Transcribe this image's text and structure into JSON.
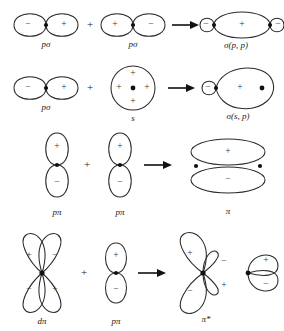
{
  "figure": {
    "background_color": "#ffffff",
    "stroke_color": "#2a2a2a",
    "nucleus_color": "#111111",
    "operator_plus": "+",
    "rows": [
      {
        "id": "row-sigma-p-p",
        "reactant_a": {
          "label": "pσ",
          "type": "p-orbital-horizontal",
          "lobes": [
            {
              "position": "left",
              "sign": "−"
            },
            {
              "position": "right",
              "sign": "+"
            }
          ]
        },
        "reactant_b": {
          "label": "pσ",
          "type": "p-orbital-horizontal",
          "lobes": [
            {
              "position": "left",
              "sign": "+"
            },
            {
              "position": "right",
              "sign": "−"
            }
          ]
        },
        "product": {
          "label": "σ(p, p)",
          "type": "sigma-bond-p-p",
          "lobes": [
            {
              "position": "left-small",
              "sign": "−"
            },
            {
              "position": "center-large",
              "sign": "+"
            },
            {
              "position": "right-small",
              "sign": "−"
            }
          ]
        }
      },
      {
        "id": "row-sigma-s-p",
        "reactant_a": {
          "label": "pσ",
          "type": "p-orbital-horizontal",
          "lobes": [
            {
              "position": "left",
              "sign": "−"
            },
            {
              "position": "right",
              "sign": "+"
            }
          ]
        },
        "reactant_b": {
          "label": "s",
          "type": "s-orbital-circle",
          "lobes": [
            {
              "position": "top",
              "sign": "+"
            },
            {
              "position": "left",
              "sign": "+"
            },
            {
              "position": "right",
              "sign": "+"
            },
            {
              "position": "bottom",
              "sign": "+"
            }
          ]
        },
        "product": {
          "label": "σ(s, p)",
          "type": "sigma-bond-s-p",
          "lobes": [
            {
              "position": "left-small",
              "sign": "−"
            },
            {
              "position": "right-large",
              "sign": "+"
            }
          ]
        }
      },
      {
        "id": "row-pi",
        "reactant_a": {
          "label": "pπ",
          "type": "p-orbital-vertical",
          "lobes": [
            {
              "position": "top",
              "sign": "+"
            },
            {
              "position": "bottom",
              "sign": "−"
            }
          ]
        },
        "reactant_b": {
          "label": "pπ",
          "type": "p-orbital-vertical",
          "lobes": [
            {
              "position": "top",
              "sign": "+"
            },
            {
              "position": "bottom",
              "sign": "−"
            }
          ]
        },
        "product": {
          "label": "π",
          "type": "pi-bond-ellipses",
          "lobes": [
            {
              "position": "top-ellipse",
              "sign": "+"
            },
            {
              "position": "bottom-ellipse",
              "sign": "−"
            }
          ]
        }
      },
      {
        "id": "row-pi-star",
        "reactant_a": {
          "label": "dπ",
          "type": "d-orbital-clover",
          "lobes": [
            {
              "position": "upper-left",
              "sign": "+"
            },
            {
              "position": "upper-right",
              "sign": "−"
            },
            {
              "position": "lower-left",
              "sign": "−"
            },
            {
              "position": "lower-right",
              "sign": "+"
            }
          ]
        },
        "reactant_b": {
          "label": "pπ",
          "type": "p-orbital-vertical",
          "lobes": [
            {
              "position": "top",
              "sign": "+"
            },
            {
              "position": "bottom",
              "sign": "−"
            }
          ]
        },
        "product": {
          "label": "π*",
          "type": "pi-antibond-clover",
          "lobes": [
            {
              "position": "upper-left-large",
              "sign": "+"
            },
            {
              "position": "upper-right-small",
              "sign": "−"
            },
            {
              "position": "lower-left-large",
              "sign": "−"
            },
            {
              "position": "lower-right-small",
              "sign": "+"
            }
          ]
        },
        "product_extra": {
          "label": "",
          "type": "p-orbital-vertical-right",
          "lobes": [
            {
              "position": "top",
              "sign": "+"
            },
            {
              "position": "bottom",
              "sign": "−"
            }
          ]
        }
      }
    ]
  }
}
